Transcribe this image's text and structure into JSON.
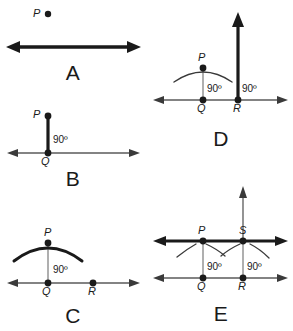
{
  "figure": {
    "background_color": "#ffffff",
    "ink_color": "#1a1a1a",
    "thin_line_color": "#5a5a5a"
  },
  "panels": [
    {
      "letter": "A",
      "points": [
        {
          "name": "P",
          "label": "P"
        }
      ],
      "angles": [],
      "description_elements": {
        "has_thick_line": true,
        "has_arc": false,
        "has_vertical_ray": false
      }
    },
    {
      "letter": "B",
      "points": [
        {
          "name": "P",
          "label": "P"
        },
        {
          "name": "Q",
          "label": "Q"
        }
      ],
      "angles": [
        {
          "label": "90º"
        }
      ],
      "description_elements": {
        "has_thick_line": false,
        "has_arc": false,
        "has_vertical_ray": true
      }
    },
    {
      "letter": "C",
      "points": [
        {
          "name": "P",
          "label": "P"
        },
        {
          "name": "Q",
          "label": "Q"
        },
        {
          "name": "R",
          "label": "R"
        }
      ],
      "angles": [
        {
          "label": "90º"
        }
      ],
      "description_elements": {
        "has_thick_line": false,
        "has_arc": true,
        "has_vertical_ray": false
      }
    },
    {
      "letter": "D",
      "points": [
        {
          "name": "P",
          "label": "P"
        },
        {
          "name": "Q",
          "label": "Q"
        },
        {
          "name": "R",
          "label": "R"
        }
      ],
      "angles": [
        {
          "label": "90º"
        },
        {
          "label": "90º"
        }
      ],
      "description_elements": {
        "has_thick_line": false,
        "has_arc": true,
        "has_vertical_ray": true
      }
    },
    {
      "letter": "E",
      "points": [
        {
          "name": "P",
          "label": "P"
        },
        {
          "name": "S",
          "label": "S"
        },
        {
          "name": "Q",
          "label": "Q"
        },
        {
          "name": "R",
          "label": "R"
        }
      ],
      "angles": [
        {
          "label": "90º"
        },
        {
          "label": "90º"
        }
      ],
      "description_elements": {
        "has_thick_line": true,
        "has_arc": true,
        "has_vertical_ray": true
      }
    }
  ],
  "labels": {
    "panel_a_letter": "A",
    "panel_b_letter": "B",
    "panel_c_letter": "C",
    "panel_d_letter": "D",
    "panel_e_letter": "E",
    "a_point_p": "P",
    "b_point_p": "P",
    "b_point_q": "Q",
    "b_angle": "90º",
    "c_point_p": "P",
    "c_point_q": "Q",
    "c_point_r": "R",
    "c_angle": "90º",
    "d_point_p": "P",
    "d_point_q": "Q",
    "d_point_r": "R",
    "d_angle_q": "90º",
    "d_angle_r": "90º",
    "e_point_p": "P",
    "e_point_s": "S",
    "e_point_q": "Q",
    "e_point_r": "R",
    "e_angle_q": "90º",
    "e_angle_r": "90º"
  }
}
